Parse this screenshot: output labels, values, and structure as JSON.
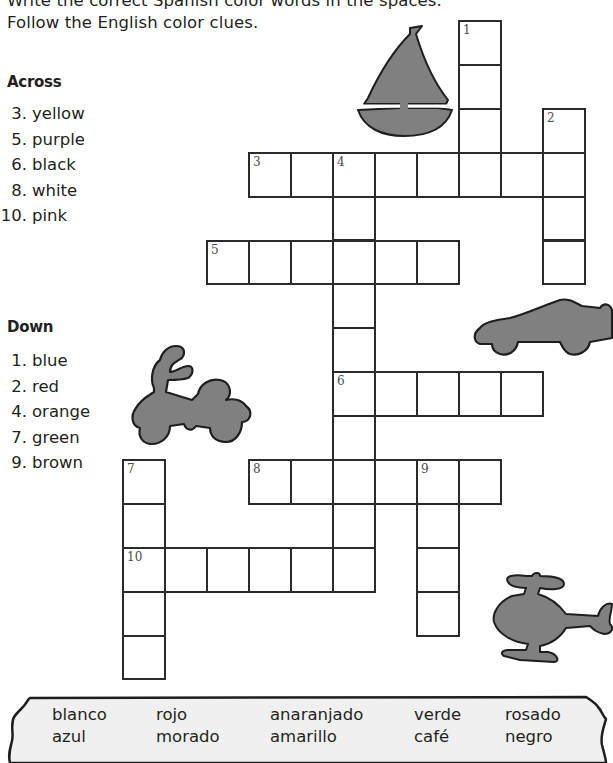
{
  "instructions": {
    "line1": "Write the correct Spanish color words in the spaces.",
    "line2": "Follow the English color clues."
  },
  "across": {
    "title": "Across",
    "clues": [
      {
        "num": "3.",
        "text": "yellow"
      },
      {
        "num": "5.",
        "text": "purple"
      },
      {
        "num": "6.",
        "text": "black"
      },
      {
        "num": "8.",
        "text": "white"
      },
      {
        "num": "10.",
        "text": "pink"
      }
    ]
  },
  "down": {
    "title": "Down",
    "clues": [
      {
        "num": "1.",
        "text": "blue"
      },
      {
        "num": "2.",
        "text": "red"
      },
      {
        "num": "4.",
        "text": "orange"
      },
      {
        "num": "7.",
        "text": "green"
      },
      {
        "num": "9.",
        "text": "brown"
      }
    ]
  },
  "puzzle": {
    "entries": [
      {
        "number": "1",
        "direction": "down",
        "col": 8,
        "row": 0,
        "length": 4
      },
      {
        "number": "2",
        "direction": "down",
        "col": 10,
        "row": 2,
        "length": 4
      },
      {
        "number": "3",
        "direction": "across",
        "col": 3,
        "row": 3,
        "length": 8
      },
      {
        "number": "4",
        "direction": "down",
        "col": 5,
        "row": 3,
        "length": 10
      },
      {
        "number": "5",
        "direction": "across",
        "col": 2,
        "row": 5,
        "length": 6
      },
      {
        "number": "6",
        "direction": "across",
        "col": 5,
        "row": 8,
        "length": 5
      },
      {
        "number": "7",
        "direction": "down",
        "col": 0,
        "row": 10,
        "length": 5
      },
      {
        "number": "8",
        "direction": "across",
        "col": 3,
        "row": 10,
        "length": 6
      },
      {
        "number": "9",
        "direction": "down",
        "col": 7,
        "row": 10,
        "length": 4
      },
      {
        "number": "10",
        "direction": "across",
        "col": 0,
        "row": 12,
        "length": 6
      }
    ]
  },
  "illustrations": [
    "sailboat-icon",
    "car-icon",
    "motorcycle-icon",
    "helicopter-icon"
  ],
  "word_bank": {
    "row1": [
      "blanco",
      "rojo",
      "anaranjado",
      "verde",
      "rosado"
    ],
    "row2": [
      "azul",
      "morado",
      "amarillo",
      "café",
      "negro"
    ]
  },
  "colors": {
    "ink": "#231f20",
    "grid_line": "#2b2b2b",
    "illustration_fill": "#808080",
    "word_bank_bg": "#f0f0f0"
  }
}
